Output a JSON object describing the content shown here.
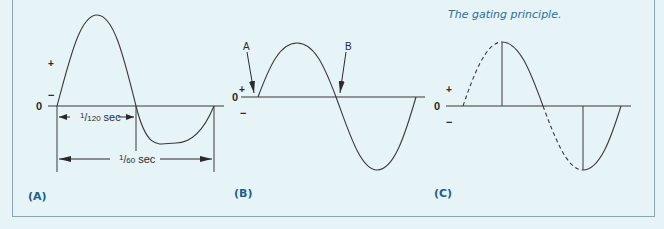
{
  "caption": "The gating principle.",
  "panels": {
    "a": {
      "tag": "(A)",
      "plus": "+",
      "zero": "0",
      "minus": "−",
      "half_period_num": "1",
      "half_period_den": "120",
      "half_period_unit": "sec",
      "full_period_num": "1",
      "full_period_den": "60",
      "full_period_unit": "sec"
    },
    "b": {
      "tag": "(B)",
      "plus": "+",
      "zero": "0",
      "minus": "−",
      "marker_a": "A",
      "marker_b": "B"
    },
    "c": {
      "tag": "(C)",
      "plus": "+",
      "zero": "0",
      "minus": "−"
    }
  },
  "colors": {
    "background": "#e6f3f7",
    "line": "#3a3a3a",
    "accent": "#1f5e86",
    "caption": "#2f6f95"
  }
}
